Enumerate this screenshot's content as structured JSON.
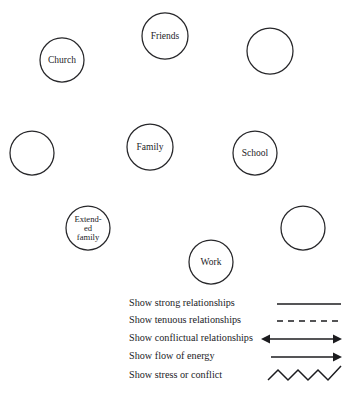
{
  "diagram": {
    "type": "ecomap",
    "canvas": {
      "width": 345,
      "height": 396,
      "background": "#ffffff"
    },
    "stroke_color": "#27272a",
    "text_color": "#1c1c1f",
    "nodes": [
      {
        "id": "church",
        "label": "Church",
        "cx": 62,
        "cy": 60,
        "r": 22,
        "empty": false,
        "lines": [
          "Church"
        ]
      },
      {
        "id": "friends",
        "label": "Friends",
        "cx": 165,
        "cy": 36,
        "r": 23,
        "empty": false,
        "lines": [
          "Friends"
        ]
      },
      {
        "id": "empty-top-right",
        "label": "",
        "cx": 270,
        "cy": 51,
        "r": 23,
        "empty": true,
        "lines": []
      },
      {
        "id": "empty-mid-left",
        "label": "",
        "cx": 32,
        "cy": 153,
        "r": 22,
        "empty": true,
        "lines": []
      },
      {
        "id": "family",
        "label": "Family",
        "cx": 150,
        "cy": 147,
        "r": 23,
        "empty": false,
        "lines": [
          "Family"
        ]
      },
      {
        "id": "school",
        "label": "School",
        "cx": 255,
        "cy": 153,
        "r": 22,
        "empty": false,
        "lines": [
          "School"
        ]
      },
      {
        "id": "extended-family",
        "label": "Extended family",
        "cx": 88,
        "cy": 228,
        "r": 22,
        "empty": false,
        "lines": [
          "Extend-",
          "ed",
          "family"
        ]
      },
      {
        "id": "empty-bottom-right",
        "label": "",
        "cx": 303,
        "cy": 228,
        "r": 22,
        "empty": true,
        "lines": []
      },
      {
        "id": "work",
        "label": "Work",
        "cx": 211,
        "cy": 262,
        "r": 22,
        "empty": false,
        "lines": [
          "Work"
        ]
      }
    ]
  },
  "legend": {
    "rows": [
      {
        "id": "strong",
        "label": "Show strong relationships",
        "symbol": "solid-line",
        "symbol_name": "solid-line-icon"
      },
      {
        "id": "tenuous",
        "label": "Show tenuous relationships",
        "symbol": "dashed-line",
        "symbol_name": "dashed-line-icon"
      },
      {
        "id": "conflictual",
        "label": "Show conflictual relationships",
        "symbol": "double-arrow",
        "symbol_name": "double-arrow-icon"
      },
      {
        "id": "energy",
        "label": "Show flow of energy",
        "symbol": "single-arrow",
        "symbol_name": "right-arrow-icon"
      },
      {
        "id": "stress",
        "label": "Show stress or conflict",
        "symbol": "zigzag-line",
        "symbol_name": "zigzag-line-icon"
      }
    ]
  }
}
